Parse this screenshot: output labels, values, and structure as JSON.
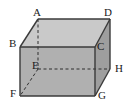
{
  "figure": {
    "kind": "rectangular-prism-diagram",
    "background_color": "#ffffff",
    "colors": {
      "top_face": "#c9c9c9",
      "front_face": "#b0b0b0",
      "right_face": "#9e9e9e",
      "edge_line": "#3a3a3a",
      "hidden_edge_line": "#2e2e2e",
      "label_text": "#1a1a1a"
    },
    "vertices": [
      {
        "id": "A",
        "label": "A",
        "role": "top-back-left",
        "x": 38,
        "y": 19,
        "hidden": false
      },
      {
        "id": "D",
        "label": "D",
        "role": "top-back-right",
        "x": 110,
        "y": 19,
        "hidden": false
      },
      {
        "id": "B",
        "label": "B",
        "role": "top-front-left",
        "x": 20,
        "y": 47,
        "hidden": false
      },
      {
        "id": "C",
        "label": "C",
        "role": "top-front-right",
        "x": 95,
        "y": 47,
        "hidden": false
      },
      {
        "id": "E",
        "label": "E",
        "role": "bottom-back-left",
        "x": 38,
        "y": 69,
        "hidden": true
      },
      {
        "id": "H",
        "label": "H",
        "role": "bottom-back-right",
        "x": 110,
        "y": 69,
        "hidden": true
      },
      {
        "id": "F",
        "label": "F",
        "role": "bottom-front-left",
        "x": 20,
        "y": 96,
        "hidden": false
      },
      {
        "id": "G",
        "label": "G",
        "role": "bottom-front-right",
        "x": 95,
        "y": 96,
        "hidden": false
      }
    ],
    "solid_edges": [
      {
        "from": "A",
        "to": "D"
      },
      {
        "from": "A",
        "to": "B"
      },
      {
        "from": "D",
        "to": "C"
      },
      {
        "from": "B",
        "to": "C"
      },
      {
        "from": "B",
        "to": "F"
      },
      {
        "from": "C",
        "to": "G"
      },
      {
        "from": "F",
        "to": "G"
      },
      {
        "from": "D",
        "to": "H"
      },
      {
        "from": "G",
        "to": "H"
      }
    ],
    "hidden_edges": [
      {
        "from": "A",
        "to": "E"
      },
      {
        "from": "E",
        "to": "H"
      },
      {
        "from": "E",
        "to": "F"
      }
    ],
    "faces": [
      {
        "id": "top",
        "vertices": [
          "A",
          "D",
          "C",
          "B"
        ],
        "fill": "#c9c9c9"
      },
      {
        "id": "front",
        "vertices": [
          "B",
          "C",
          "G",
          "F"
        ],
        "fill": "#b0b0b0"
      },
      {
        "id": "right",
        "vertices": [
          "D",
          "H",
          "G",
          "C"
        ],
        "fill": "#9e9e9e"
      }
    ]
  }
}
